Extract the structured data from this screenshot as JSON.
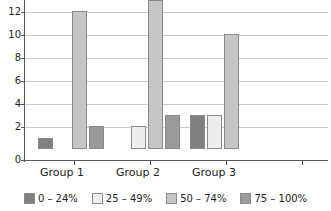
{
  "chart_data": {
    "type": "bar",
    "title": "",
    "subtitle": "",
    "xlabel": "",
    "ylabel": "",
    "categories": [
      "Group 1",
      "Group 2",
      "Group 3"
    ],
    "series": [
      {
        "name": "0 – 24%",
        "color": "#808080",
        "values": [
          1,
          0,
          3
        ]
      },
      {
        "name": "25 – 49%",
        "color": "#ededed",
        "values": [
          0,
          2,
          3
        ]
      },
      {
        "name": "50 – 74%",
        "color": "#c6c6c6",
        "values": [
          12,
          13,
          10
        ]
      },
      {
        "name": "75 – 100%",
        "color": "#9a9a9a",
        "values": [
          2,
          3,
          0
        ]
      }
    ],
    "ylim": [
      0,
      14
    ],
    "ytick_labels": [
      "0",
      "2",
      "4",
      "6",
      "8",
      "10",
      "12"
    ],
    "ytick_values": [
      0,
      2,
      4,
      6,
      8,
      10,
      12
    ],
    "grid": true,
    "grid_color": "#c9c9c9",
    "axis_color": "#585858",
    "legend_position": "bottom",
    "bar_border_color": "#8a8a8a",
    "background": "#ffffff",
    "note": "Plot is cropped at the top edge; the 14 gridline/label is not visible."
  },
  "axis": {
    "y_labels": [
      "12",
      "10",
      "8",
      "6",
      "4",
      "2",
      "0"
    ]
  },
  "legend": {
    "items": [
      {
        "label": "0 – 24%"
      },
      {
        "label": "25 – 49%"
      },
      {
        "label": "50 – 74%"
      },
      {
        "label": "75 – 100%"
      }
    ]
  },
  "groups": {
    "labels": [
      "Group 1",
      "Group 2",
      "Group 3"
    ]
  }
}
